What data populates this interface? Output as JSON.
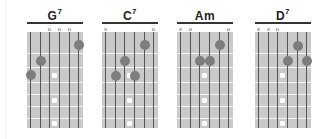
{
  "chords": [
    {
      "name": "G",
      "sup": "7",
      "left": 27,
      "markers": [
        {
          "string": 3,
          "symbol": "o"
        },
        {
          "string": 4,
          "symbol": "o"
        },
        {
          "string": 5,
          "symbol": "o"
        }
      ],
      "dots": [
        {
          "string": 6,
          "y": 45
        },
        {
          "string": 2,
          "y": 61
        },
        {
          "string": 1,
          "y": 75
        }
      ]
    },
    {
      "name": "C",
      "sup": "7",
      "left": 102,
      "markers": [
        {
          "string": 1,
          "symbol": "x"
        },
        {
          "string": 6,
          "symbol": "o"
        }
      ],
      "dots": [
        {
          "string": 5,
          "y": 45
        },
        {
          "string": 3,
          "y": 61
        },
        {
          "string": 2,
          "y": 76
        },
        {
          "string": 4,
          "y": 76
        }
      ]
    },
    {
      "name": "Am",
      "sup": "",
      "left": 177,
      "markers": [
        {
          "string": 1,
          "symbol": "x"
        },
        {
          "string": 2,
          "symbol": "o"
        },
        {
          "string": 6,
          "symbol": "o"
        }
      ],
      "dots": [
        {
          "string": 5,
          "y": 45
        },
        {
          "string": 3,
          "y": 61
        },
        {
          "string": 4,
          "y": 61
        }
      ]
    },
    {
      "name": "D",
      "sup": "7",
      "left": 255,
      "markers": [
        {
          "string": 1,
          "symbol": "x"
        },
        {
          "string": 2,
          "symbol": "x"
        },
        {
          "string": 3,
          "symbol": "o"
        }
      ],
      "dots": [
        {
          "string": 5,
          "y": 46
        },
        {
          "string": 4,
          "y": 61
        },
        {
          "string": 6,
          "y": 61
        }
      ]
    }
  ],
  "layout": {
    "string_x": [
      3,
      13,
      22,
      32,
      42,
      51
    ],
    "fret_y": [
      21,
      35,
      50,
      62,
      74,
      86
    ],
    "inlay_y": [
      43,
      68,
      91
    ]
  },
  "colors": {
    "grid": "#c9c9c9",
    "dot": "#7d7d7d",
    "inlay": "#ffffff",
    "string": "#555555"
  }
}
